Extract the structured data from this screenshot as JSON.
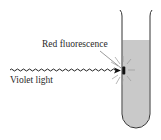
{
  "diagram": {
    "labels": {
      "fluorescence": "Red fluorescence",
      "incident": "Violet light"
    },
    "elements": [
      "test-tube",
      "liquid",
      "wavy-light-ray",
      "arrow-head",
      "emission-spot",
      "emission-rays",
      "leader-line"
    ],
    "colors": {
      "liquid": "#c9c9c9",
      "outline": "#333333",
      "text": "#2a2a2a",
      "background": "#ffffff"
    }
  }
}
